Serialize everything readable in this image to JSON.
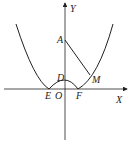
{
  "figure": {
    "axes": {
      "x_label": "X",
      "y_label": "Y",
      "origin_label": "O"
    },
    "points": {
      "A": "A",
      "D": "D",
      "E": "E",
      "F": "F",
      "M": "M"
    },
    "colors": {
      "stroke": "#222222",
      "background": "#ffffff"
    }
  }
}
